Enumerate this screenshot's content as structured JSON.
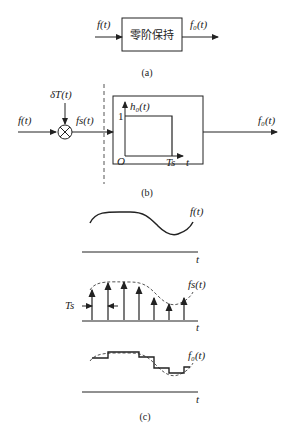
{
  "panel_a": {
    "input_label": "f(t)",
    "block_label": "零阶保持",
    "output_label": "f₀(t)",
    "caption": "(a)"
  },
  "panel_b": {
    "input_label": "f(t)",
    "impulse_label": "δT(t)",
    "sampled_label": "fs(t)",
    "inner_plot": {
      "ylabel": "h₀(t)",
      "y_tick": "1",
      "origin": "O",
      "x_tick": "Ts",
      "xlabel": "t"
    },
    "output_label": "f₀(t)",
    "caption": "(b)"
  },
  "panel_c": {
    "plot1": {
      "curve_label": "f(t)",
      "axis_label": "t"
    },
    "plot2": {
      "curve_label": "fs(t)",
      "period_label": "Ts",
      "axis_label": "t"
    },
    "plot3": {
      "curve_label": "f₀(t)",
      "axis_label": "t"
    },
    "caption": "(c)"
  },
  "colors": {
    "line": "#222222",
    "dashed": "#555555"
  }
}
